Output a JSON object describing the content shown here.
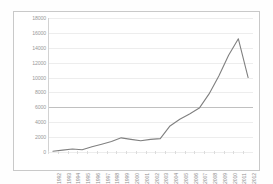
{
  "chart_data": {
    "type": "line",
    "title": "",
    "xlabel": "",
    "ylabel": "",
    "ylim": [
      0,
      18000
    ],
    "yticks": [
      0,
      2000,
      4000,
      6000,
      8000,
      10000,
      12000,
      14000,
      16000,
      18000
    ],
    "ytick_labels": [
      "0",
      "2000",
      "4000",
      "6000",
      "8000",
      "10000",
      "12000",
      "14000",
      "16000",
      "18000"
    ],
    "grid": true,
    "legend": "none",
    "line_color": "#808080",
    "categories": [
      "1992",
      "1993",
      "1994",
      "1995",
      "1996",
      "1997",
      "1998",
      "1999",
      "2000",
      "2001",
      "2002",
      "2003",
      "2004",
      "2005",
      "2006",
      "2007",
      "2008",
      "2009",
      "2010",
      "2011",
      "2012"
    ],
    "values": [
      100,
      250,
      400,
      300,
      700,
      1050,
      1400,
      1900,
      1700,
      1500,
      1700,
      1800,
      3500,
      4400,
      5100,
      5900,
      7800,
      10200,
      13000,
      15200,
      10000
    ]
  },
  "colors": {
    "line": "#808080",
    "grid": "#ededed",
    "grid_strong": "#c0c0c0",
    "border": "#c9c9c9",
    "tick_text": "#9a9a9a",
    "background": "#ffffff"
  }
}
